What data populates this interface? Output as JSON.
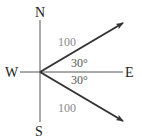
{
  "diagram": {
    "type": "vector-compass",
    "directions": {
      "north": "N",
      "south": "S",
      "west": "W",
      "east": "E"
    },
    "vectors": [
      {
        "name": "upper",
        "magnitude_label": "100",
        "angle_label": "30°",
        "direction": "30° north of east"
      },
      {
        "name": "lower",
        "magnitude_label": "100",
        "angle_label": "30°",
        "direction": "30° south of east"
      }
    ],
    "colors": {
      "axis": "#444444",
      "vector": "#333333",
      "magnitude_text": "#8a8a8a",
      "angle_text": "#555555",
      "direction_text": "#222222"
    }
  }
}
